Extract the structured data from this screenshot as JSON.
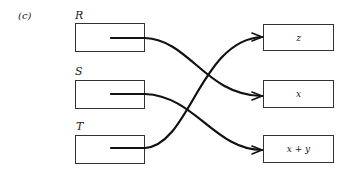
{
  "panel_label": "(c)",
  "sources": [
    {
      "label": "R"
    },
    {
      "label": "S"
    },
    {
      "label": "T"
    }
  ],
  "targets": [
    {
      "label": "z"
    },
    {
      "label": "x"
    },
    {
      "label": "x + y"
    }
  ],
  "mappings": [
    {
      "from": "R",
      "to": "x"
    },
    {
      "from": "S",
      "to": "x + y"
    },
    {
      "from": "T",
      "to": "z"
    }
  ]
}
